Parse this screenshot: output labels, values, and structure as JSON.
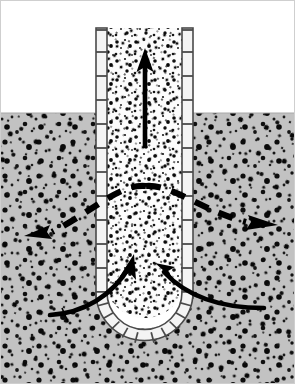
{
  "figure": {
    "canvas": {
      "width": 295,
      "height": 384
    },
    "colors": {
      "sky": "#ffffff",
      "soil": "#c0c0c0",
      "soil_speckle": "#101010",
      "shaft_fill": "#fbfbfb",
      "shaft_speckle": "#111111",
      "lining_stroke": "#4a4a4a",
      "lining_fill": "#f4f4f4",
      "arrow_solid": "#000000",
      "arrow_dashed": "#000000",
      "frame": "#bdbdbd"
    }
  },
  "ground": {
    "surface_y": 113,
    "label": "ground-surface-line"
  },
  "shaft": {
    "left_wall_x": 96,
    "right_wall_x": 182,
    "wall_thickness": 11,
    "top_y": 28,
    "bottom_curve_start_y": 292,
    "bottom_y": 340,
    "rung_spacing": 24,
    "rung_count_left": 12,
    "rung_count_right": 12,
    "bottom_segment_count": 9
  },
  "arrows": {
    "upward_flow": {
      "name": "upward-flow-arrow",
      "style": "solid",
      "x": 145,
      "tail_y": 148,
      "head_y": 50,
      "direction": "up",
      "meaning": "upward seepage / water rising in shaft"
    },
    "dashed_spread_left": {
      "name": "dashed-flow-arrow-left",
      "style": "dashed",
      "direction": "left",
      "start": [
        146,
        186
      ],
      "end": [
        28,
        236
      ],
      "meaning": "drawdown / lateral groundwater flow toward shaft"
    },
    "dashed_spread_right": {
      "name": "dashed-flow-arrow-right",
      "style": "dashed",
      "direction": "right",
      "start": [
        146,
        186
      ],
      "end": [
        276,
        226
      ],
      "meaning": "drawdown / lateral groundwater flow toward shaft"
    },
    "inflow_left": {
      "name": "base-inflow-arrow-left",
      "style": "solid-curved",
      "direction": "up-right",
      "start": [
        52,
        314
      ],
      "end": [
        134,
        262
      ],
      "meaning": "base inflow / heave at shaft bottom"
    },
    "inflow_right": {
      "name": "base-inflow-arrow-right",
      "style": "solid-curved",
      "direction": "up-left",
      "start": [
        262,
        308
      ],
      "end": [
        158,
        266
      ],
      "meaning": "base inflow / heave at shaft bottom"
    }
  },
  "regions": {
    "above_ground": "sky-region",
    "soil_left": "soil-region-left",
    "soil_right": "soil-region-right",
    "shaft_interior": "shaft-interior-region"
  }
}
